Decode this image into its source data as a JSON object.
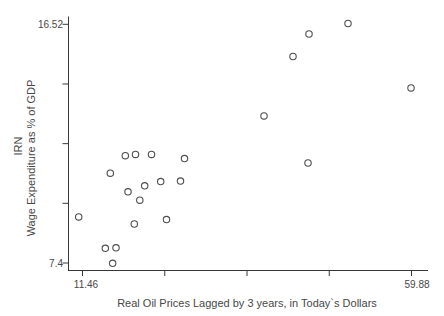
{
  "chart_data": {
    "type": "scatter",
    "title": "",
    "xlabel": "Real Oil Prices Lagged by 3 years, in Today`s Dollars",
    "ylabel": "Wage Expenditure as % of GDP",
    "ylabel_group": "IRN",
    "xlim": [
      11.46,
      59.88
    ],
    "ylim": [
      7.4,
      16.52
    ],
    "x_tick_values": [
      11.46,
      23.565,
      35.67,
      47.775,
      59.88
    ],
    "x_tick_labels": [
      "11.46",
      "",
      "",
      "",
      "59.88"
    ],
    "y_tick_values": [
      16.52,
      14.24,
      11.96,
      9.68,
      7.4
    ],
    "y_tick_labels": [
      "16.52",
      "",
      "",
      "",
      "7.4"
    ],
    "grid": "off",
    "legend": "none",
    "marker": {
      "shape": "hollow-circle",
      "color": "#4d4d4d"
    },
    "points": [
      [
        50.53,
        16.55
      ],
      [
        44.79,
        16.15
      ],
      [
        42.44,
        15.29
      ],
      [
        59.81,
        14.09
      ],
      [
        38.17,
        13.02
      ],
      [
        44.65,
        11.22
      ],
      [
        26.47,
        11.39
      ],
      [
        17.76,
        11.5
      ],
      [
        19.26,
        11.55
      ],
      [
        21.61,
        11.55
      ],
      [
        15.55,
        10.83
      ],
      [
        20.61,
        10.35
      ],
      [
        22.97,
        10.51
      ],
      [
        25.88,
        10.53
      ],
      [
        18.16,
        10.12
      ],
      [
        19.89,
        9.8
      ],
      [
        10.9,
        9.16
      ],
      [
        19.08,
        8.89
      ],
      [
        23.82,
        9.06
      ],
      [
        14.82,
        7.96
      ],
      [
        16.39,
        7.98
      ],
      [
        15.91,
        7.39
      ]
    ]
  },
  "colors": {
    "background": "#ffffff",
    "text": "#474747",
    "axis": "#383838",
    "marker": "#4d4d4d"
  }
}
